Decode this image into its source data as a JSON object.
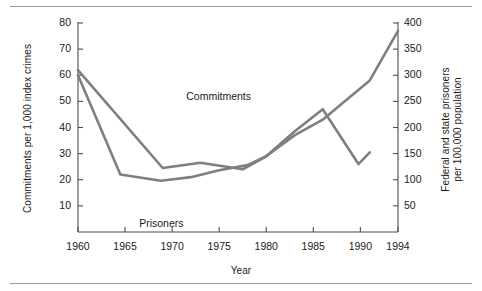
{
  "chart_data": {
    "type": "line",
    "title": "",
    "xlabel": "Year",
    "ylabel_left": "Commitments per 1,000 index crimes",
    "ylabel_right_line1": "Federal and state prisoners",
    "ylabel_right_line2": "per 100,000 population",
    "xlim": [
      1960,
      1994
    ],
    "ylim_left": [
      0,
      80
    ],
    "ylim_right": [
      0,
      400
    ],
    "grid": false,
    "legend_position": "inline-annotations",
    "x_ticks": [
      1960,
      1965,
      1970,
      1975,
      1980,
      1985,
      1990,
      1994
    ],
    "x_tick_labels": [
      "1960",
      "1965",
      "1970",
      "1975",
      "1980",
      "1985",
      "1990",
      "1994"
    ],
    "y_ticks_left": [
      10,
      20,
      30,
      40,
      50,
      60,
      70,
      80
    ],
    "y_tick_labels_left": [
      "10",
      "20",
      "30",
      "40",
      "50",
      "60",
      "70",
      "80"
    ],
    "y_ticks_right": [
      50,
      100,
      150,
      200,
      250,
      300,
      350,
      400
    ],
    "y_tick_labels_right": [
      "50",
      "100",
      "150",
      "200",
      "250",
      "300",
      "350",
      "400"
    ],
    "line_color": "#7f7f7f",
    "line_width": 2.6,
    "series": [
      {
        "name": "Commitments",
        "axis": "left",
        "label_x": 1971.5,
        "label_y": 51.5,
        "points": [
          [
            1960,
            62.0
          ],
          [
            1969,
            24.5
          ],
          [
            1973,
            26.5
          ],
          [
            1977.5,
            24.0
          ],
          [
            1980,
            29.0
          ],
          [
            1983,
            38.5
          ],
          [
            1986,
            47.0
          ],
          [
            1989.8,
            26.0
          ],
          [
            1991,
            30.5
          ]
        ]
      },
      {
        "name": "Prisoners",
        "axis": "right",
        "label_x": 1966.5,
        "label_y": 15.5,
        "points": [
          [
            1960,
            300
          ],
          [
            1964.5,
            110
          ],
          [
            1968.8,
            98
          ],
          [
            1972,
            105
          ],
          [
            1975,
            118
          ],
          [
            1978,
            128
          ],
          [
            1980,
            145
          ],
          [
            1983,
            185
          ],
          [
            1986,
            215
          ],
          [
            1988,
            245
          ],
          [
            1991,
            290
          ],
          [
            1994,
            385
          ]
        ]
      }
    ],
    "annotations": [
      {
        "text": "Commitments",
        "x": 1971.5,
        "y": 51.5
      },
      {
        "text": "Prisoners",
        "x": 1966.5,
        "y": 15.5
      }
    ]
  }
}
